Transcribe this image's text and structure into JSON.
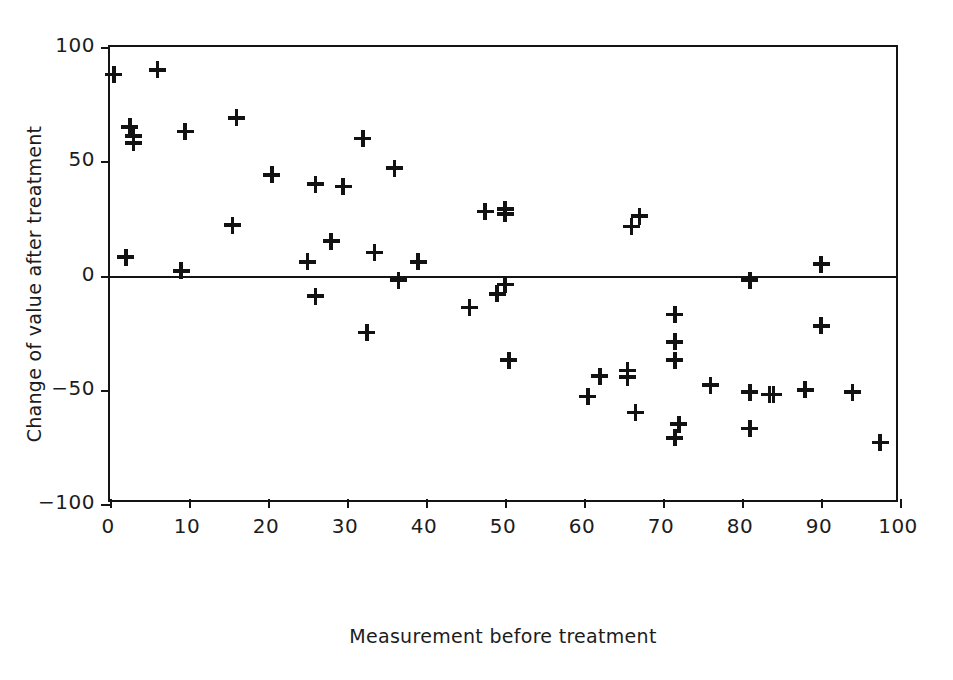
{
  "chart_data": {
    "type": "scatter",
    "title": "",
    "xlabel": "Measurement before treatment",
    "ylabel": "Change of value after treatment",
    "xlim": [
      0,
      100
    ],
    "ylim": [
      -100,
      100
    ],
    "xticks": [
      0,
      10,
      20,
      30,
      40,
      50,
      60,
      70,
      80,
      90,
      100
    ],
    "yticks": [
      -100,
      -50,
      0,
      50,
      100
    ],
    "xtick_labels": [
      "0",
      "10",
      "20",
      "30",
      "40",
      "50",
      "60",
      "70",
      "80",
      "90",
      "100"
    ],
    "ytick_labels": [
      "−100",
      "−50",
      "0",
      "50",
      "100"
    ],
    "grid": false,
    "legend": null,
    "marker": "plus",
    "marker_color": "#121212",
    "reference_lines": [
      {
        "axis": "y",
        "value": 0
      }
    ],
    "n_points": 55,
    "points": [
      {
        "x": 0.5,
        "y": 88
      },
      {
        "x": 6,
        "y": 90
      },
      {
        "x": 2.5,
        "y": 65
      },
      {
        "x": 3,
        "y": 61
      },
      {
        "x": 3,
        "y": 58
      },
      {
        "x": 9.5,
        "y": 63
      },
      {
        "x": 16,
        "y": 69
      },
      {
        "x": 15.5,
        "y": 22
      },
      {
        "x": 2,
        "y": 8
      },
      {
        "x": 9,
        "y": 2
      },
      {
        "x": 20.5,
        "y": 44
      },
      {
        "x": 25,
        "y": 6
      },
      {
        "x": 26,
        "y": 40
      },
      {
        "x": 26,
        "y": -9
      },
      {
        "x": 28,
        "y": 15
      },
      {
        "x": 29.5,
        "y": 39
      },
      {
        "x": 32,
        "y": 60
      },
      {
        "x": 32.5,
        "y": -25
      },
      {
        "x": 33.5,
        "y": 10
      },
      {
        "x": 36,
        "y": 47
      },
      {
        "x": 36.5,
        "y": -2
      },
      {
        "x": 39,
        "y": 6
      },
      {
        "x": 45.5,
        "y": -14
      },
      {
        "x": 47.5,
        "y": 28
      },
      {
        "x": 49,
        "y": -8
      },
      {
        "x": 50,
        "y": 29
      },
      {
        "x": 50,
        "y": 27
      },
      {
        "x": 50,
        "y": -4
      },
      {
        "x": 50.5,
        "y": -37
      },
      {
        "x": 60.5,
        "y": -53
      },
      {
        "x": 62,
        "y": -44
      },
      {
        "x": 65.5,
        "y": -41.5
      },
      {
        "x": 65.5,
        "y": -44.5
      },
      {
        "x": 66,
        "y": 21.5
      },
      {
        "x": 67,
        "y": 26
      },
      {
        "x": 66.5,
        "y": -60
      },
      {
        "x": 71.5,
        "y": -17
      },
      {
        "x": 71.5,
        "y": -29
      },
      {
        "x": 71.5,
        "y": -37
      },
      {
        "x": 71.5,
        "y": -71
      },
      {
        "x": 72,
        "y": -65
      },
      {
        "x": 76,
        "y": -48
      },
      {
        "x": 81,
        "y": -2
      },
      {
        "x": 81,
        "y": -51
      },
      {
        "x": 81,
        "y": -67
      },
      {
        "x": 83.5,
        "y": -52
      },
      {
        "x": 84,
        "y": -52
      },
      {
        "x": 88,
        "y": -50
      },
      {
        "x": 90,
        "y": 5
      },
      {
        "x": 90,
        "y": -22
      },
      {
        "x": 94,
        "y": -51
      },
      {
        "x": 97.5,
        "y": -73
      }
    ]
  },
  "axes": {
    "x_title": "Measurement before treatment",
    "y_title": "Change of value after treatment"
  }
}
